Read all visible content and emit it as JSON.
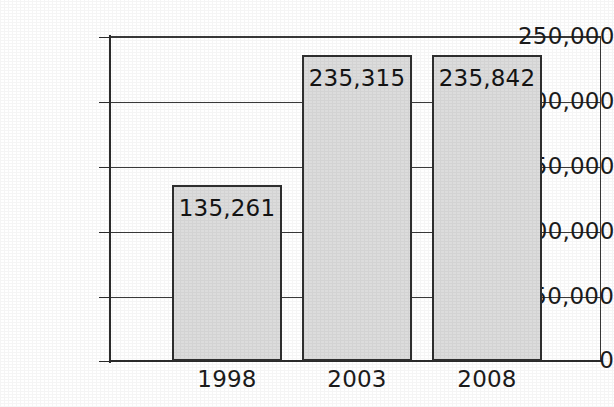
{
  "chart_data": {
    "type": "bar",
    "title": "",
    "subtitle": "",
    "xlabel": "",
    "ylabel": "",
    "categories": [
      "1998",
      "2003",
      "2008"
    ],
    "values": [
      135261,
      235315,
      235842
    ],
    "value_labels": [
      "135,261",
      "235,315",
      "235,842"
    ],
    "ylim": [
      0,
      250000
    ],
    "ytick_values": [
      0,
      50000,
      100000,
      150000,
      200000,
      250000
    ],
    "ytick_labels": [
      "0",
      "50,000",
      "100,000",
      "150,000",
      "200,000",
      "250,000"
    ],
    "grid": true,
    "grid_axis": "y",
    "legend": false,
    "legend_position": "none",
    "annotations": [],
    "bar_fill_color": "#dcdcdc",
    "bar_border_color": "#2f2f2f",
    "axis_color": "#2b2b2b",
    "grid_color": "#3a3a3a",
    "background_color": "#ffffff",
    "text_color": "#1c1c1c"
  },
  "yaxis": {
    "ticks": [
      {
        "label": "250,000",
        "value": 250000,
        "y": 37
      },
      {
        "label": "200,000",
        "value": 200000,
        "y": 102
      },
      {
        "label": "150,000",
        "value": 150000,
        "y": 167
      },
      {
        "label": "100,000",
        "value": 100000,
        "y": 232
      },
      {
        "label": "50,000",
        "value": 50000,
        "y": 297
      },
      {
        "label": "0",
        "value": 0,
        "y": 361
      }
    ]
  },
  "bars": [
    {
      "category": "1998",
      "value": 135261,
      "value_label": "135,261",
      "left": 172,
      "width": 110,
      "top": 185,
      "height": 176
    },
    {
      "category": "2003",
      "value": 235315,
      "value_label": "235,315",
      "left": 302,
      "width": 110,
      "top": 55,
      "height": 306
    },
    {
      "category": "2008",
      "value": 235842,
      "value_label": "235,842",
      "left": 432,
      "width": 110,
      "top": 55,
      "height": 306
    }
  ],
  "xaxis": {
    "labels": [
      {
        "text": "1998",
        "left": 172,
        "width": 110
      },
      {
        "text": "2003",
        "left": 302,
        "width": 110
      },
      {
        "text": "2008",
        "left": 432,
        "width": 110
      }
    ]
  }
}
